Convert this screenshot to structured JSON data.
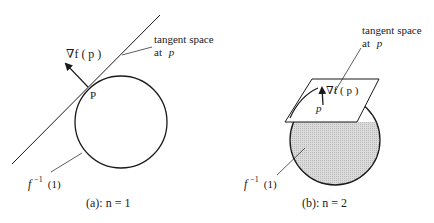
{
  "panel_a": {
    "gradient_label": "∇f ( p )",
    "point_label": "P",
    "tangent_label_line1": "tangent space",
    "tangent_label_line2_prefix": "at",
    "tangent_label_line2_var": "p",
    "level_set_label_f": "f",
    "level_set_label_sup": "−1",
    "level_set_label_arg": "(1)",
    "caption": "(a): n = 1"
  },
  "panel_b": {
    "gradient_label": "∇f ( p )",
    "point_label": "p",
    "tangent_label_line1": "tangent space",
    "tangent_label_line2_prefix": "at",
    "tangent_label_line2_var": "p",
    "level_set_label_f": "f",
    "level_set_label_sup": "−1",
    "level_set_label_arg": "(1)",
    "caption": "(b): n = 2"
  },
  "colors": {
    "stroke": "#1a1a1a",
    "sphere_fill": "#d4d4d4",
    "plane_fill": "#ffffff"
  }
}
